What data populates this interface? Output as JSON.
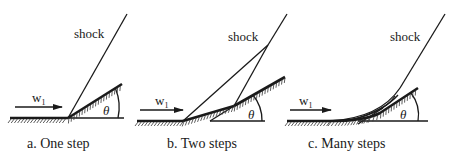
{
  "figure": {
    "panels": [
      {
        "id": "a",
        "caption": "a. One step",
        "shock_label": "shock",
        "flow_label": "w",
        "flow_subscript": "1",
        "angle_label": "θ"
      },
      {
        "id": "b",
        "caption": "b. Two steps",
        "shock_label": "shock",
        "flow_label": "w",
        "flow_subscript": "1",
        "angle_label": "θ"
      },
      {
        "id": "c",
        "caption": "c. Many steps",
        "shock_label": "shock",
        "flow_label": "w",
        "flow_subscript": "1",
        "angle_label": "θ"
      }
    ]
  }
}
